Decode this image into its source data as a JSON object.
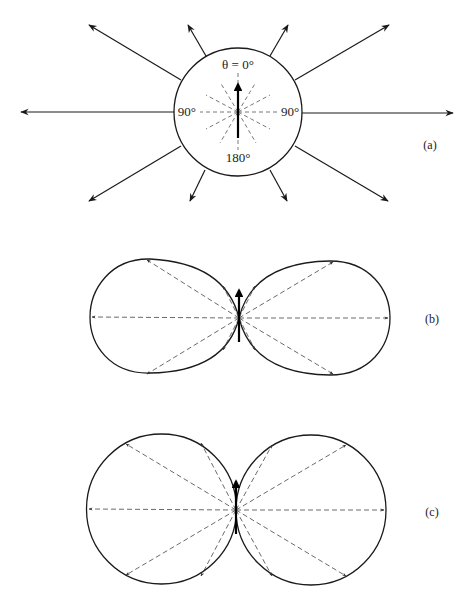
{
  "figure": {
    "panels": [
      {
        "id": "a",
        "label": "(a)",
        "description": "Isotropic radiation: sphere with arrows radiating equally in all directions",
        "angle_labels": {
          "top": "θ = 0°",
          "left": "90°",
          "right": "90°",
          "bottom": "180°"
        }
      },
      {
        "id": "b",
        "label": "(b)",
        "description": "Dipole-like radiation pattern: two elongated lobes"
      },
      {
        "id": "c",
        "label": "(c)",
        "description": "sin²θ radiation pattern: two circular lobes tangent at the dipole"
      }
    ],
    "colors": {
      "stroke": "#1a1a1a",
      "dashed": "#444444",
      "background": "#ffffff"
    }
  }
}
